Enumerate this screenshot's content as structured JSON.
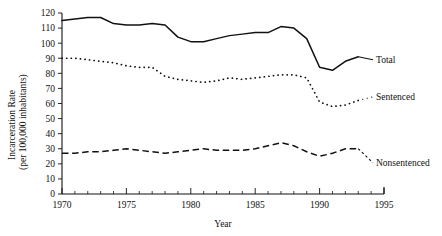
{
  "chart_data": {
    "type": "line",
    "title": "",
    "xlabel": "Year",
    "ylabel": "Incarceration Rate\n(per 100,000 inhabitants)",
    "ylabel_line1": "Incarceration Rate",
    "ylabel_line2": "(per 100,000 inhabitants)",
    "xlim": [
      1970,
      1995
    ],
    "ylim": [
      0,
      120
    ],
    "grid": false,
    "legend_position": "right-inline",
    "x": [
      1970,
      1971,
      1972,
      1973,
      1974,
      1975,
      1976,
      1977,
      1978,
      1979,
      1980,
      1981,
      1982,
      1983,
      1984,
      1985,
      1986,
      1987,
      1988,
      1989,
      1990,
      1991,
      1992,
      1993
    ],
    "y_ticks": [
      0,
      10,
      20,
      30,
      40,
      50,
      60,
      70,
      80,
      90,
      100,
      110,
      120
    ],
    "y_tick_labels": [
      "0",
      "10",
      "20",
      "30",
      "40",
      "50",
      "60",
      "70",
      "80",
      "90",
      "100",
      "110",
      "120"
    ],
    "x_ticks": [
      1970,
      1975,
      1980,
      1985,
      1990,
      1995
    ],
    "x_tick_labels": [
      "1970",
      "1975",
      "1980",
      "1985",
      "1990",
      "1995"
    ],
    "x_minor_ticks": [
      1971,
      1972,
      1973,
      1974,
      1976,
      1977,
      1978,
      1979,
      1981,
      1982,
      1983,
      1984,
      1986,
      1987,
      1988,
      1989,
      1991,
      1992,
      1993,
      1994
    ],
    "series": [
      {
        "name": "Total",
        "style": "solid",
        "label": "Total",
        "values": [
          115,
          116,
          117,
          117,
          113,
          112,
          112,
          113,
          112,
          104,
          101,
          101,
          103,
          105,
          106,
          107,
          107,
          111,
          110,
          103,
          84,
          82,
          88,
          91
        ]
      },
      {
        "name": "Sentenced",
        "style": "dotted",
        "label": "Sentenced",
        "values": [
          90,
          90,
          89,
          88,
          87,
          85,
          84,
          84,
          78,
          76,
          75,
          74,
          75,
          77,
          76,
          77,
          78,
          79,
          79,
          77,
          61,
          58,
          59,
          62
        ]
      },
      {
        "name": "Nonsentenced",
        "style": "dashed",
        "label": "Nonsentenced",
        "values": [
          27,
          27,
          28,
          28,
          29,
          30,
          29,
          28,
          27,
          28,
          29,
          30,
          29,
          29,
          29,
          30,
          32,
          34,
          32,
          28,
          25,
          27,
          30,
          30
        ]
      }
    ]
  }
}
